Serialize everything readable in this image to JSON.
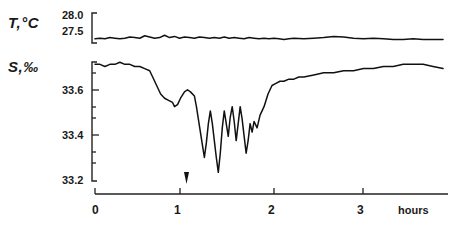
{
  "chart_data": {
    "type": "line",
    "title": "",
    "xlabel": "hours",
    "x_ticks": [
      0,
      1,
      2,
      3
    ],
    "x_tick_labels": [
      "0",
      "1",
      "2",
      "3"
    ],
    "xlim": [
      0,
      3.55
    ],
    "grid": false,
    "legend_position": "none",
    "annotations": [
      {
        "name": "event-marker",
        "type": "down-arrow",
        "x": 1.15,
        "label": ""
      }
    ],
    "series": [
      {
        "name": "T,°C",
        "axis_label": "T,°C",
        "ylabel": "T,°C",
        "units": "°C",
        "ylim": [
          27.5,
          28.0
        ],
        "y_ticks": [
          27.5,
          28.0
        ],
        "y_tick_labels": [
          "27.5",
          "28.0"
        ],
        "x": [
          0.0,
          0.05,
          0.1,
          0.15,
          0.2,
          0.25,
          0.3,
          0.35,
          0.4,
          0.45,
          0.5,
          0.55,
          0.6,
          0.65,
          0.7,
          0.75,
          0.8,
          0.85,
          0.9,
          0.95,
          1.0,
          1.05,
          1.1,
          1.15,
          1.2,
          1.25,
          1.3,
          1.35,
          1.4,
          1.45,
          1.5,
          1.55,
          1.6,
          1.65,
          1.7,
          1.75,
          1.8,
          1.85,
          1.9,
          1.95,
          2.0,
          2.1,
          2.2,
          2.3,
          2.4,
          2.5,
          2.6,
          2.7,
          2.8,
          2.9,
          3.0,
          3.1,
          3.2,
          3.3,
          3.4,
          3.5
        ],
        "values": [
          27.57,
          27.58,
          27.57,
          27.59,
          27.58,
          27.57,
          27.58,
          27.6,
          27.59,
          27.58,
          27.62,
          27.6,
          27.58,
          27.59,
          27.63,
          27.59,
          27.61,
          27.58,
          27.6,
          27.59,
          27.58,
          27.6,
          27.59,
          27.58,
          27.59,
          27.58,
          27.6,
          27.58,
          27.59,
          27.58,
          27.57,
          27.59,
          27.58,
          27.57,
          27.58,
          27.57,
          27.58,
          27.57,
          27.56,
          27.57,
          27.58,
          27.57,
          27.58,
          27.59,
          27.61,
          27.6,
          27.58,
          27.57,
          27.58,
          27.57,
          27.56,
          27.56,
          27.57,
          27.56,
          27.56,
          27.56
        ]
      },
      {
        "name": "S,‰",
        "axis_label": "S,‰",
        "ylabel": "S,‰",
        "units": "‰",
        "ylim": [
          33.15,
          33.75
        ],
        "y_ticks": [
          33.2,
          33.4,
          33.6
        ],
        "y_tick_labels": [
          "33.2",
          "33.4",
          "33.6"
        ],
        "y_minor_ticks": [
          33.25,
          33.3,
          33.35,
          33.45,
          33.5,
          33.55,
          33.65,
          33.7
        ],
        "x": [
          0.0,
          0.05,
          0.1,
          0.15,
          0.2,
          0.25,
          0.3,
          0.35,
          0.4,
          0.45,
          0.5,
          0.55,
          0.58,
          0.62,
          0.66,
          0.7,
          0.74,
          0.78,
          0.8,
          0.83,
          0.86,
          0.9,
          0.93,
          0.96,
          1.0,
          1.02,
          1.04,
          1.06,
          1.08,
          1.1,
          1.12,
          1.14,
          1.16,
          1.18,
          1.2,
          1.22,
          1.24,
          1.26,
          1.28,
          1.3,
          1.32,
          1.34,
          1.36,
          1.38,
          1.4,
          1.42,
          1.44,
          1.46,
          1.48,
          1.5,
          1.52,
          1.54,
          1.56,
          1.58,
          1.6,
          1.63,
          1.66,
          1.7,
          1.74,
          1.78,
          1.82,
          1.86,
          1.9,
          1.95,
          2.0,
          2.05,
          2.1,
          2.2,
          2.3,
          2.4,
          2.5,
          2.6,
          2.7,
          2.8,
          2.9,
          3.0,
          3.1,
          3.2,
          3.3,
          3.4,
          3.5
        ],
        "values": [
          33.72,
          33.72,
          33.71,
          33.72,
          33.72,
          33.73,
          33.72,
          33.72,
          33.71,
          33.71,
          33.7,
          33.69,
          33.66,
          33.62,
          33.58,
          33.56,
          33.55,
          33.54,
          33.52,
          33.53,
          33.56,
          33.59,
          33.6,
          33.59,
          33.57,
          33.52,
          33.46,
          33.4,
          33.34,
          33.28,
          33.35,
          33.44,
          33.5,
          33.44,
          33.36,
          33.28,
          33.21,
          33.3,
          33.42,
          33.5,
          33.44,
          33.38,
          33.47,
          33.52,
          33.45,
          33.36,
          33.44,
          33.52,
          33.46,
          33.38,
          33.3,
          33.36,
          33.44,
          33.4,
          33.45,
          33.42,
          33.48,
          33.52,
          33.58,
          33.62,
          33.63,
          33.64,
          33.64,
          33.65,
          33.65,
          33.66,
          33.66,
          33.67,
          33.68,
          33.68,
          33.69,
          33.69,
          33.7,
          33.7,
          33.71,
          33.71,
          33.72,
          33.72,
          33.72,
          33.71,
          33.7
        ]
      }
    ]
  },
  "axes": {
    "temp_label": "T,°C",
    "sal_label": "S,‰",
    "temp_top": "28.0",
    "temp_bottom": "27.5",
    "sal_336": "33.6",
    "sal_334": "33.4",
    "sal_332": "33.2",
    "x0": "0",
    "x1": "1",
    "x2": "2",
    "x3": "3",
    "x_units": "hours"
  }
}
